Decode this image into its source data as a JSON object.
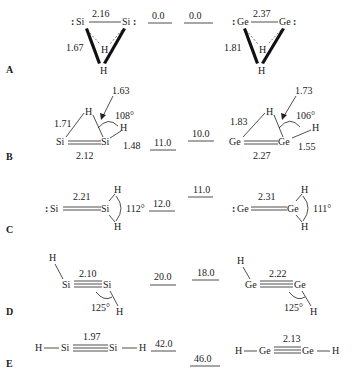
{
  "rows": [
    {
      "label": "A",
      "si": {
        "atoms": [
          "Si",
          "Si",
          "H",
          "H"
        ],
        "bond_SiSi": "2.16",
        "bond_SiH": "1.67"
      },
      "si_energy": "0.0",
      "ge_energy": "0.0",
      "ge": {
        "atoms": [
          "Ge",
          "Ge",
          "H",
          "H"
        ],
        "bond_GeGe": "2.37",
        "bond_GeH": "1.81"
      }
    },
    {
      "label": "B",
      "si": {
        "atoms": [
          "Si",
          "Si",
          "H",
          "H"
        ],
        "bond_SiSi": "2.12",
        "bond_bridge": "1.71",
        "bond_arrow": "1.63",
        "angle": "108°",
        "bond_terminal": "1.48"
      },
      "si_energy": "11.0",
      "ge_energy": "10.0",
      "ge": {
        "atoms": [
          "Ge",
          "Ge",
          "H",
          "H"
        ],
        "bond_GeGe": "2.27",
        "bond_bridge": "1.83",
        "bond_arrow": "1.73",
        "angle": "106°",
        "bond_terminal": "1.55"
      }
    },
    {
      "label": "C",
      "si": {
        "atoms": [
          "Si",
          "Si",
          "H",
          "H"
        ],
        "bond_SiSi": "2.21",
        "angle": "112°"
      },
      "si_energy": "12.0",
      "ge_energy": "11.0",
      "ge": {
        "atoms": [
          "Ge",
          "Ge",
          "H",
          "H"
        ],
        "bond_GeGe": "2.31",
        "angle": "111°"
      }
    },
    {
      "label": "D",
      "si": {
        "atoms": [
          "H",
          "Si",
          "Si",
          "H"
        ],
        "bond_SiSi": "2.10",
        "angle": "125°"
      },
      "si_energy": "20.0",
      "ge_energy": "18.0",
      "ge": {
        "atoms": [
          "H",
          "Ge",
          "Ge",
          "H"
        ],
        "bond_GeGe": "2.22",
        "angle": "125°"
      }
    },
    {
      "label": "E",
      "si": {
        "atoms": [
          "H",
          "Si",
          "Si",
          "H"
        ],
        "bond_SiSi": "1.97"
      },
      "si_energy": "42.0",
      "ge_energy": "46.0",
      "ge": {
        "atoms": [
          "H",
          "Ge",
          "Ge",
          "H"
        ],
        "bond_GeGe": "2.13"
      }
    }
  ]
}
